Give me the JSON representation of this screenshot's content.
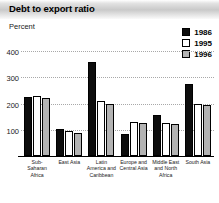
{
  "header": {
    "title": "Debt to export ratio"
  },
  "chart_data": {
    "type": "bar",
    "title": "Debt to export ratio",
    "subtitle": "",
    "xlabel": "",
    "ylabel": "Percent",
    "unit_label": "Percent",
    "ylim": [
      0,
      420
    ],
    "yticks": [
      100,
      200,
      300,
      400
    ],
    "grid": true,
    "legend_position": "top-right",
    "categories": [
      "Sub-Saharan Africa",
      "East Asia",
      "Latin America and Caribbean",
      "Europe and Central Asia",
      "Middle East and North Africa",
      "South Asia"
    ],
    "series": [
      {
        "name": "1986",
        "color": "#0d0d0d",
        "values": [
          225,
          105,
          360,
          85,
          155,
          275
        ]
      },
      {
        "name": "1995",
        "color": "#ffffff",
        "values": [
          230,
          95,
          210,
          128,
          125,
          200
        ]
      },
      {
        "name": "1996",
        "color": "#b3b3b3",
        "values": [
          222,
          88,
          200,
          125,
          122,
          193
        ]
      }
    ]
  }
}
